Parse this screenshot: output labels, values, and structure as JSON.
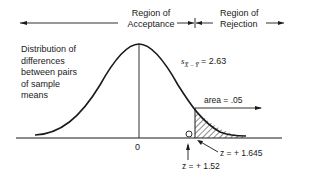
{
  "diagram": {
    "regions": {
      "acceptance_line1": "Region of",
      "acceptance_line2": "Acceptance",
      "rejection_line1": "Region of",
      "rejection_line2": "Rejection"
    },
    "description": {
      "line1": "Distribution of",
      "line2": "differences",
      "line3": "between pairs",
      "line4": "of sample",
      "line5": "means"
    },
    "standard_error": "s",
    "standard_error_sub": "X̅ − Y̅",
    "standard_error_value": "= 2.63",
    "area_label": "area = .05",
    "zero_label": "0",
    "critical_z": "z  = + 1.645",
    "observed_z": "z  = + 1.52",
    "colors": {
      "ink": "#1a1a1a",
      "background": "#ffffff"
    }
  }
}
